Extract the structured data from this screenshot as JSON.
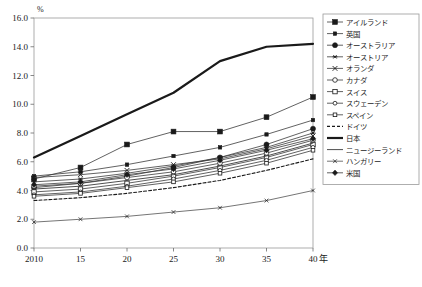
{
  "chart_data": {
    "type": "line",
    "title": "",
    "xlabel": "年",
    "ylabel": "%",
    "yunit": "%",
    "xlim": [
      2010,
      2040
    ],
    "ylim": [
      0.0,
      16.0
    ],
    "grid": false,
    "legend_position": "right",
    "x": [
      2010,
      2015,
      2020,
      2025,
      2030,
      2035,
      2040
    ],
    "xtick_labels": [
      "2010",
      "15",
      "20",
      "25",
      "30",
      "35",
      "40"
    ],
    "ytick_labels": [
      "0.0",
      "2.0",
      "4.0",
      "6.0",
      "8.0",
      "10.0",
      "12.0",
      "14.0",
      "16.0"
    ],
    "ytick_values": [
      0.0,
      2.0,
      4.0,
      6.0,
      8.0,
      10.0,
      12.0,
      14.0,
      16.0
    ],
    "series": [
      {
        "name": "アイルランド",
        "marker": "filled-square",
        "style": "solid",
        "width": 0.8,
        "values": [
          4.8,
          5.6,
          7.2,
          8.1,
          8.1,
          9.1,
          10.5
        ]
      },
      {
        "name": "英国",
        "marker": "small-filled-square",
        "style": "solid",
        "width": 0.8,
        "values": [
          5.0,
          5.3,
          5.8,
          6.4,
          7.0,
          7.9,
          8.9
        ]
      },
      {
        "name": "オーストラリア",
        "marker": "filled-circle",
        "style": "solid",
        "width": 0.8,
        "values": [
          4.2,
          4.5,
          5.0,
          5.6,
          6.3,
          7.2,
          8.3
        ]
      },
      {
        "name": "オーストリア",
        "marker": "asterisk",
        "style": "solid",
        "width": 0.8,
        "values": [
          4.6,
          4.8,
          5.2,
          5.7,
          6.3,
          7.0,
          8.0
        ]
      },
      {
        "name": "オランダ",
        "marker": "cross",
        "style": "solid",
        "width": 0.8,
        "values": [
          4.9,
          5.1,
          5.4,
          5.8,
          6.2,
          6.9,
          7.8
        ]
      },
      {
        "name": "カナダ",
        "marker": "open-circle",
        "style": "solid",
        "width": 0.8,
        "values": [
          4.3,
          4.5,
          4.9,
          5.3,
          5.9,
          6.6,
          7.5
        ]
      },
      {
        "name": "スイス",
        "marker": "open-square",
        "style": "solid",
        "width": 0.8,
        "values": [
          3.9,
          4.1,
          4.5,
          5.0,
          5.6,
          6.3,
          7.2
        ]
      },
      {
        "name": "スウェーデン",
        "marker": "open-circle-small",
        "style": "solid",
        "width": 0.8,
        "values": [
          3.7,
          3.9,
          4.3,
          4.8,
          5.4,
          6.1,
          7.0
        ]
      },
      {
        "name": "スペイン",
        "marker": "open-square-small",
        "style": "solid",
        "width": 0.8,
        "values": [
          3.6,
          3.8,
          4.2,
          4.6,
          5.2,
          5.9,
          6.8
        ]
      },
      {
        "name": "ドイツ",
        "marker": "none",
        "style": "dashed",
        "width": 1.1,
        "values": [
          3.3,
          3.5,
          3.8,
          4.2,
          4.7,
          5.4,
          6.2
        ]
      },
      {
        "name": "日本",
        "marker": "none",
        "style": "solid",
        "width": 2.2,
        "values": [
          6.3,
          7.8,
          9.3,
          10.8,
          13.0,
          14.0,
          14.2
        ]
      },
      {
        "name": "ニュージーランド",
        "marker": "none",
        "style": "solid",
        "width": 0.9,
        "values": [
          4.1,
          4.3,
          4.7,
          5.1,
          5.7,
          6.4,
          7.3
        ]
      },
      {
        "name": "ハンガリー",
        "marker": "cross-small",
        "style": "solid",
        "width": 0.7,
        "values": [
          1.8,
          2.0,
          2.2,
          2.5,
          2.8,
          3.3,
          4.0
        ]
      },
      {
        "name": "米国",
        "marker": "filled-diamond",
        "style": "solid",
        "width": 0.8,
        "values": [
          4.4,
          4.6,
          5.1,
          5.5,
          6.1,
          6.8,
          7.6
        ]
      }
    ]
  },
  "caption": {
    "text": ""
  }
}
